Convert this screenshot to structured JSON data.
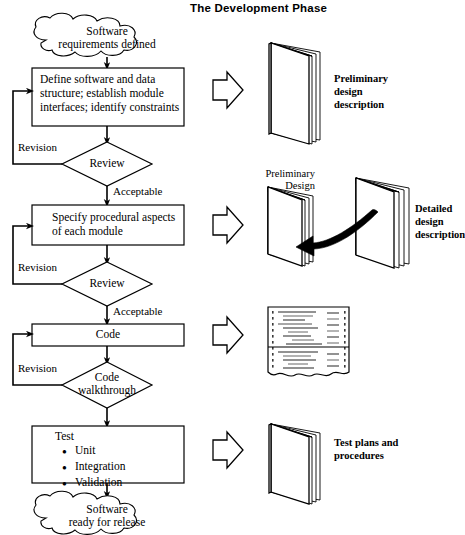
{
  "title": "The Development Phase",
  "flow": {
    "start_cloud": {
      "line1": "Software",
      "line2": "requirements defined"
    },
    "end_cloud": {
      "line1": "Software",
      "line2": "ready for release"
    },
    "process_1": {
      "line1": "Define software and data",
      "line2": "structure; establish module",
      "line3": "interfaces; identify constraints"
    },
    "decision_1": {
      "label": "Review"
    },
    "process_2": {
      "line1": "Specify procedural aspects",
      "line2": "of each module"
    },
    "decision_2": {
      "label": "Review"
    },
    "process_3": {
      "label": "Code"
    },
    "decision_3": {
      "line1": "Code",
      "line2": "walkthrough"
    },
    "process_4": {
      "label": "Test",
      "items": [
        "Unit",
        "Integration",
        "Validation"
      ]
    },
    "edge_labels": {
      "revision_1": "Revision",
      "revision_2": "Revision",
      "revision_3": "Revision",
      "acceptable_1": "Acceptable",
      "acceptable_2": "Acceptable"
    }
  },
  "outputs": [
    {
      "icon": "book-icon",
      "label_line1": "Preliminary",
      "label_line2": "design",
      "label_line3": "description"
    },
    {
      "icon": "two-books-with-arrow-icon",
      "inner_label_line1": "Preliminary",
      "inner_label_line2": "Design",
      "label_line1": "Detailed",
      "label_line2": "design",
      "label_line3": "description"
    },
    {
      "icon": "code-listing-icon",
      "label_line1": "",
      "label_line2": "",
      "label_line3": ""
    },
    {
      "icon": "book-icon",
      "label_line1": "Test plans and",
      "label_line2": "procedures",
      "label_line3": ""
    }
  ],
  "colors": {
    "stroke": "#000000",
    "background": "#ffffff",
    "code_text": "#6e6e6e"
  }
}
